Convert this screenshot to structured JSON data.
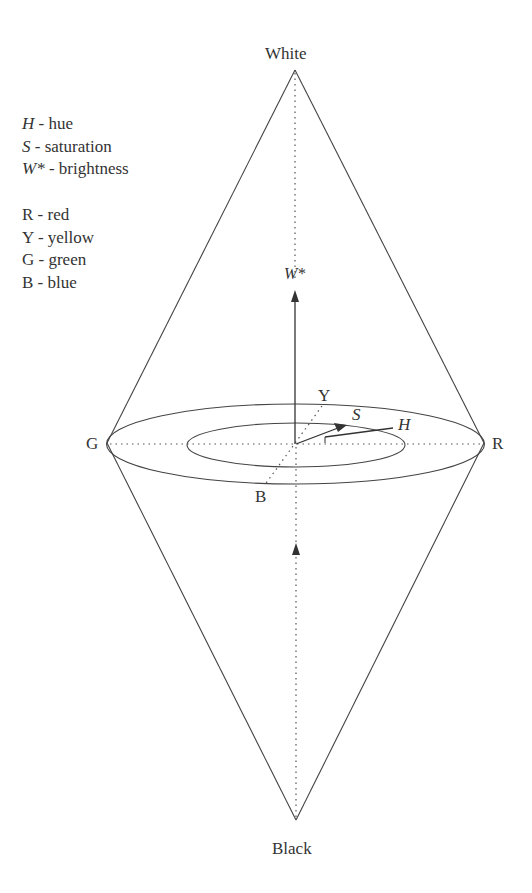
{
  "labels": {
    "top": "White",
    "bottom": "Black",
    "left": "G",
    "right": "R",
    "yellow_axis": "Y",
    "blue_axis": "B",
    "brightness_axis": "W*",
    "saturation": "S",
    "hue": "H"
  },
  "legend_variables": [
    {
      "symbol": "H",
      "text": " - hue"
    },
    {
      "symbol": "S",
      "text": " - saturation"
    },
    {
      "symbol": "W*",
      "text": " - brightness"
    }
  ],
  "legend_colors": [
    {
      "symbol": "R",
      "text": " - red"
    },
    {
      "symbol": "Y",
      "text": " - yellow"
    },
    {
      "symbol": "G",
      "text": " - green"
    },
    {
      "symbol": "B",
      "text": " - blue"
    }
  ],
  "colors": {
    "line": "#444444",
    "text": "#333333",
    "background": "#ffffff"
  }
}
